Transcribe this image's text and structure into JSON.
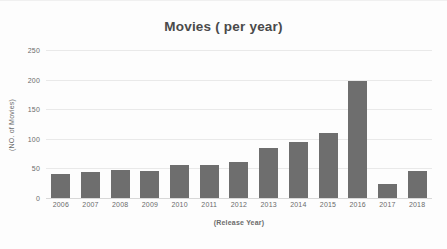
{
  "chart_data": {
    "type": "bar",
    "title": "Movies ( per year)",
    "xlabel": "(Release Year)",
    "ylabel": "(NO. of Movies)",
    "categories": [
      "2006",
      "2007",
      "2008",
      "2009",
      "2010",
      "2011",
      "2012",
      "2013",
      "2014",
      "2015",
      "2016",
      "2017",
      "2018"
    ],
    "values": [
      40,
      44,
      48,
      45,
      55,
      55,
      60,
      84,
      94,
      110,
      197,
      23,
      45
    ],
    "ylim": [
      0,
      250
    ],
    "yticks": [
      0,
      50,
      100,
      150,
      200,
      250
    ],
    "ytick_labels": [
      "0",
      "50",
      "100",
      "150",
      "200",
      "250"
    ],
    "grid": true,
    "legend": false,
    "legend_position": "none",
    "bar_color": "#6e6e6e",
    "gridline_color": "#e9e9e9",
    "text_color": "#6b6b6b",
    "title_color": "#4a4a4a",
    "background_color": "#fdfdfd"
  }
}
